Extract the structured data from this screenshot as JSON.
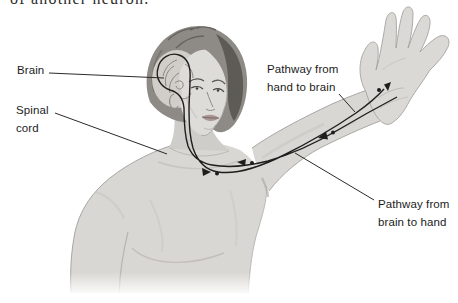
{
  "page": {
    "top_text_fragment": "of another neuron."
  },
  "diagram": {
    "labels": {
      "brain": "Brain",
      "spinal_cord": "Spinal\ncord",
      "hand_to_brain": "Pathway from\nhand to brain",
      "brain_to_hand": "Pathway from\nbrain to hand"
    },
    "colors": {
      "background": "#ffffff",
      "skin": "#d9d7d3",
      "skin_highlight": "#e7e5e1",
      "skin_shadow": "#b9b7b3",
      "hair": "#8e8b86",
      "hair_dark": "#55524e",
      "brain_window": "#d8d4cf",
      "pathway_line": "#1f1e1c",
      "leader_line": "#2a2a28",
      "label_text": "#1c1c1c"
    }
  }
}
